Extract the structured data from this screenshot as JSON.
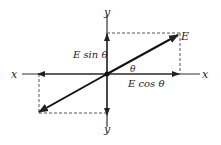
{
  "diagram": {
    "axis_labels": {
      "x_left": "x",
      "x_right": "x",
      "y_top": "y",
      "y_bottom": "y"
    },
    "vector_label": "E",
    "sin_component_label": "E sin θ",
    "cos_component_label": "E cos θ",
    "angle_label": "θ",
    "colors": {
      "line": "#222222",
      "dashed": "#555555",
      "background": "#ffffff"
    }
  }
}
